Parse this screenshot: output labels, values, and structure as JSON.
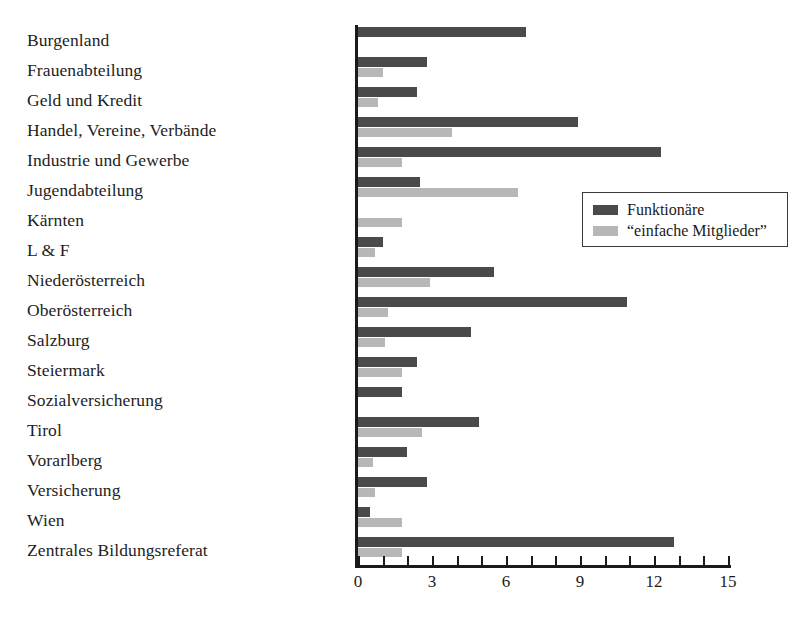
{
  "chart_data": {
    "type": "bar",
    "orientation": "horizontal",
    "title": "",
    "xlabel": "",
    "ylabel": "",
    "xlim": [
      0,
      15
    ],
    "xticks": [
      0,
      3,
      6,
      9,
      12,
      15
    ],
    "xtick_labels": [
      "0",
      "3",
      "6",
      "9",
      "12",
      "15"
    ],
    "minor_tick_step": 1,
    "grid": false,
    "legend_position": "right",
    "categories": [
      "Burgenland",
      "Frauenabteilung",
      "Geld und Kredit",
      "Handel, Vereine, Verbände",
      "Industrie und Gewerbe",
      "Jugendabteilung",
      "Kärnten",
      "L & F",
      "Niederösterreich",
      "Oberösterreich",
      "Salzburg",
      "Steiermark",
      "Sozialversicherung",
      "Tirol",
      "Vorarlberg",
      "Versicherung",
      "Wien",
      "Zentrales Bildungsreferat"
    ],
    "series": [
      {
        "name": "Funktionäre",
        "color": "#4a4a4a",
        "values": [
          6.8,
          2.8,
          2.4,
          8.9,
          12.3,
          2.5,
          0,
          1.0,
          5.5,
          10.9,
          4.6,
          2.4,
          1.8,
          4.9,
          2.0,
          2.8,
          0.5,
          12.8
        ]
      },
      {
        "name": "“einfache Mitglieder”",
        "color": "#b7b7b7",
        "values": [
          0,
          1.0,
          0.8,
          3.8,
          1.8,
          6.5,
          1.8,
          0.7,
          2.9,
          1.2,
          1.1,
          1.8,
          0,
          2.6,
          0.6,
          0.7,
          1.8,
          1.8
        ]
      }
    ]
  }
}
